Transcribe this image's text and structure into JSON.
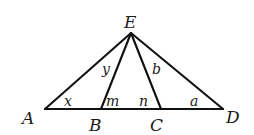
{
  "figure": {
    "type": "geometry-diagram",
    "stroke_color": "#111111",
    "background": "#ffffff",
    "points": {
      "E": {
        "label": "E",
        "x": 131,
        "y": 33
      },
      "A": {
        "label": "A",
        "x": 45,
        "y": 109
      },
      "B": {
        "label": "B",
        "x": 101,
        "y": 109
      },
      "C": {
        "label": "C",
        "x": 161,
        "y": 109
      },
      "D": {
        "label": "D",
        "x": 223,
        "y": 109
      }
    },
    "segments": [
      [
        "A",
        "D"
      ],
      [
        "E",
        "A"
      ],
      [
        "E",
        "B"
      ],
      [
        "E",
        "C"
      ],
      [
        "E",
        "D"
      ]
    ],
    "angles": {
      "x": {
        "label": "x",
        "at": "A",
        "between": [
          "AD",
          "AE"
        ]
      },
      "y": {
        "label": "y",
        "at": "E",
        "between": [
          "EA",
          "EB"
        ]
      },
      "m": {
        "label": "m",
        "at": "B",
        "between": [
          "BC",
          "BE"
        ]
      },
      "n": {
        "label": "n",
        "at": "C",
        "between": [
          "CB",
          "CE"
        ]
      },
      "b": {
        "label": "b",
        "at": "E",
        "between": [
          "EC",
          "ED"
        ]
      },
      "a": {
        "label": "a",
        "at": "D",
        "between": [
          "DA",
          "DE"
        ]
      }
    }
  }
}
